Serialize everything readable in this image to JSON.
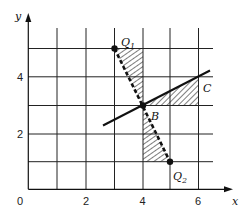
{
  "diagram": {
    "type": "coordinate-geometry",
    "axes": {
      "x_label": "x",
      "y_label": "y",
      "origin_label": "0",
      "x_ticks": [
        "2",
        "4",
        "6"
      ],
      "y_ticks": [
        "2",
        "4"
      ],
      "grid": {
        "x_from": 0,
        "x_to": 6,
        "y_from": 0,
        "y_to": 5,
        "step": 1
      }
    },
    "points": [
      {
        "id": "Q1",
        "label": "Q",
        "sub": "1",
        "x": 3,
        "y": 5,
        "marked": true
      },
      {
        "id": "B",
        "label": "B",
        "x": 4,
        "y": 3,
        "marked": true
      },
      {
        "id": "Q2",
        "label": "Q",
        "sub": "2",
        "x": 5,
        "y": 1,
        "marked": true
      },
      {
        "id": "C",
        "label": "C",
        "x": 6,
        "y": 4,
        "marked": false
      }
    ],
    "lines": [
      {
        "name": "dashed-line-Q1-Q2",
        "from": [
          3,
          5
        ],
        "to": [
          5,
          1
        ],
        "style": "dashed-thick"
      },
      {
        "name": "solid-line-through-B",
        "from": [
          2.6,
          2.3
        ],
        "to": [
          6.4,
          4.2
        ],
        "style": "solid-thick"
      }
    ],
    "hatched_regions": [
      {
        "name": "upper-triangle",
        "vertices": [
          [
            3,
            5
          ],
          [
            4,
            5
          ],
          [
            4,
            3
          ]
        ]
      },
      {
        "name": "lower-triangle",
        "vertices": [
          [
            4,
            3
          ],
          [
            4,
            1
          ],
          [
            5,
            1
          ]
        ]
      },
      {
        "name": "right-triangle",
        "vertices": [
          [
            4,
            3
          ],
          [
            6,
            4
          ],
          [
            6,
            3
          ]
        ]
      }
    ]
  }
}
